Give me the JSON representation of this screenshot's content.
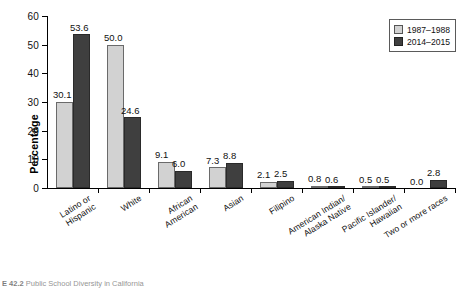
{
  "chart_data": {
    "type": "bar",
    "title": "",
    "xlabel": "",
    "ylabel": "Percentage",
    "ylim": [
      0,
      60
    ],
    "yticks": [
      0,
      10,
      20,
      30,
      40,
      50,
      60
    ],
    "grid": false,
    "legend_position": "top-right",
    "categories": [
      "Latino or\nHispanic",
      "White",
      "African\nAmerican",
      "Asian",
      "Filipino",
      "American Indian/\nAlaska Native",
      "Pacific Islander/\nHawaiian",
      "Two or more races"
    ],
    "series": [
      {
        "name": "1987–1988",
        "color": "#d2d2d2",
        "values": [
          30.1,
          50.0,
          9.1,
          7.3,
          2.1,
          0.8,
          0.5,
          0.0
        ],
        "labels": [
          "30.1",
          "50.0",
          "9.1",
          "7.3",
          "2.1",
          "0.8",
          "0.5",
          "0.0"
        ]
      },
      {
        "name": "2014–2015",
        "color": "#3f3f3f",
        "values": [
          53.6,
          24.6,
          6.0,
          8.8,
          2.5,
          0.6,
          0.5,
          2.8
        ],
        "labels": [
          "53.6",
          "24.6",
          "6.0",
          "8.8",
          "2.5",
          "0.6",
          "0.5",
          "2.8"
        ]
      }
    ]
  },
  "legend": {
    "items": [
      {
        "label": "1987–1988",
        "swatch": "light-gray-swatch"
      },
      {
        "label": "2014–2015",
        "swatch": "dark-gray-swatch"
      }
    ]
  },
  "caption": {
    "figure_number": "E 42.2",
    "text": "Public School Diversity in California"
  }
}
